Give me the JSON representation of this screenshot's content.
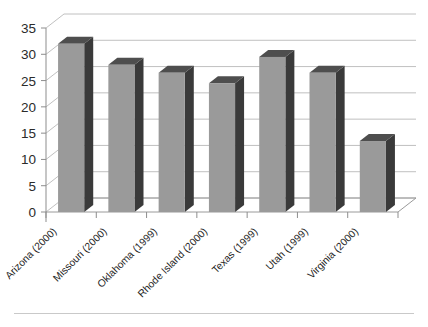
{
  "chart_data": {
    "type": "bar",
    "title": "",
    "xlabel": "",
    "ylabel": "",
    "ylim": [
      0,
      35
    ],
    "ytick_values": [
      0,
      5,
      10,
      15,
      20,
      25,
      30,
      35
    ],
    "ytick_labels": [
      "0",
      "5",
      "10",
      "15",
      "20",
      "25",
      "30",
      "35"
    ],
    "grid": true,
    "legend": "none",
    "style": "3d-column",
    "categories": [
      "Arizona (2000)",
      "Missouri (2000)",
      "Oklahoma (1999)",
      "Rhode Island (2000)",
      "Texas (1999)",
      "Utah (1999)",
      "Virginia (2000)"
    ],
    "values": [
      32,
      28,
      26.5,
      24.5,
      29.5,
      26.5,
      13.5
    ],
    "xtick_label_rotation": 45,
    "colors": {
      "bar_front": "#9a9a9a",
      "bar_side": "#3a3a3a",
      "bar_top": "#4e4e4e",
      "gridline": "#b9b9b9",
      "axis": "#8d8d8d",
      "background": "#ffffff",
      "text": "#1f1f1f"
    }
  }
}
